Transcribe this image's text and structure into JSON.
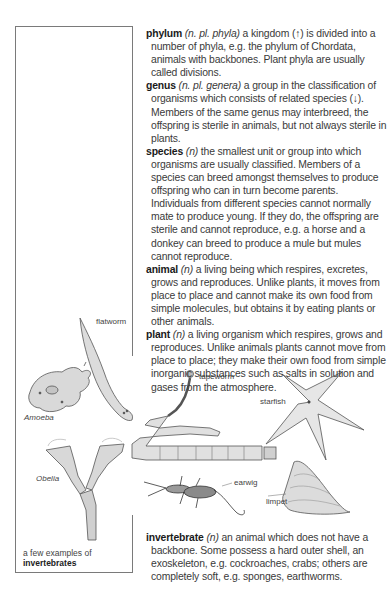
{
  "entries": [
    {
      "headword": "phylum",
      "grammar": "(n. pl. phyla)",
      "text": " a kingdom (↑) is divided into a number of phyla, e.g. the phylum of Chordata, animals with backbones. Plant phyla are usually called divisions."
    },
    {
      "headword": "genus",
      "grammar": "(n. pl. genera)",
      "text": " a group in the classification of organisms which consists of related species (↓). Members of the same genus may interbreed, the offspring is sterile in animals, but not always sterile in plants."
    },
    {
      "headword": "species",
      "grammar": "(n)",
      "text": " the smallest unit or group into which organisms are usually classified. Members of a species can breed amongst themselves to produce offspring who can in turn become parents. Individuals from different species cannot normally mate to produce young. If they do, the offspring are sterile and cannot reproduce, e.g. a horse and a donkey can breed to produce a mule but mules cannot reproduce."
    },
    {
      "headword": "animal",
      "grammar": "(n)",
      "text": " a living being which respires, excretes, grows and reproduces. Unlike plants, it moves from place to place and cannot make its own food from simple molecules, but obtains it by eating plants or other animals."
    },
    {
      "headword": "plant",
      "grammar": "(n)",
      "text": " a living organism which respires, grows and reproduces. Unlike animals plants cannot move from place to place; they make their own food from simple inorganic substances such as salts in solution and gases from the atmosphere."
    }
  ],
  "invertebrate": {
    "headword": "invertebrate",
    "grammar": "(n)",
    "text": " an animal which does not have a backbone. Some possess a hard outer shell, an exoskeleton, e.g. cockroaches, crabs; others are completely soft, e.g. sponges, earthworms."
  },
  "figure": {
    "caption_line1": "a few examples of",
    "caption_line2": "invertebrates",
    "labels": {
      "flatworm": "flatworm",
      "amoeba": "Amoeba",
      "tapeworm": "tapeworm",
      "starfish": "starfish",
      "obelia": "Obelia",
      "earwig": "earwig",
      "limpet": "limpet"
    }
  }
}
